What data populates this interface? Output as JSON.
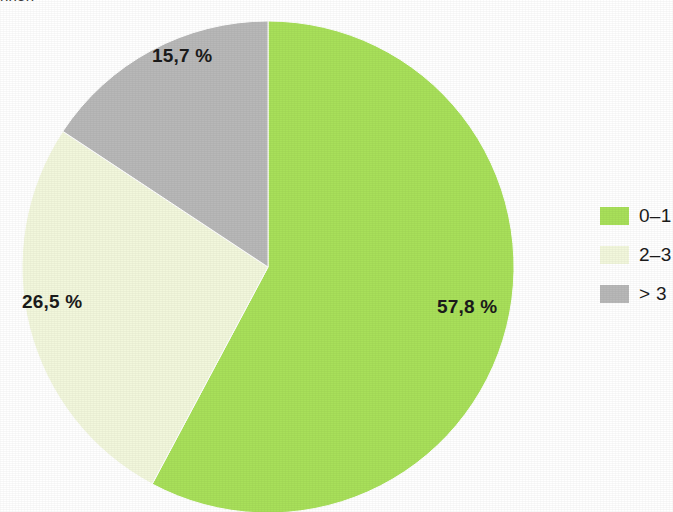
{
  "caption": {
    "clipped_text": "nnen"
  },
  "chart_data": {
    "type": "pie",
    "title": "",
    "subtitle": "",
    "xlabel": "",
    "ylabel": "",
    "grid": false,
    "legend_position": "right",
    "value_suffix": " %",
    "decimal_separator": ",",
    "start_angle_deg": 0,
    "direction": "clockwise",
    "center": {
      "x": 268,
      "y": 267
    },
    "radius": 246,
    "categories": [
      "0–1",
      "2–3",
      "> 3"
    ],
    "values": [
      57.8,
      26.5,
      15.7
    ],
    "labels": [
      "57,8 %",
      "26,5 %",
      "15,7 %"
    ],
    "colors": [
      "#a8e05a",
      "#f2f7dc",
      "#b8b8b8"
    ],
    "slices": [
      {
        "category": "0–1",
        "value": 57.8,
        "label": "57,8 %",
        "color": "#a8e05a",
        "start_deg": 0.0,
        "end_deg": 208.08
      },
      {
        "category": "2–3",
        "value": 26.5,
        "label": "26,5 %",
        "color": "#f2f7dc",
        "start_deg": 208.08,
        "end_deg": 303.48
      },
      {
        "category": "> 3",
        "value": 15.7,
        "label": "15,7 %",
        "color": "#b8b8b8",
        "start_deg": 303.48,
        "end_deg": 360.0
      }
    ]
  },
  "legend": {
    "items": [
      {
        "label": "0–1",
        "color": "#a8e05a"
      },
      {
        "label": "2–3",
        "color": "#f2f7dc"
      },
      {
        "label": "> 3",
        "color": "#b8b8b8"
      }
    ]
  }
}
